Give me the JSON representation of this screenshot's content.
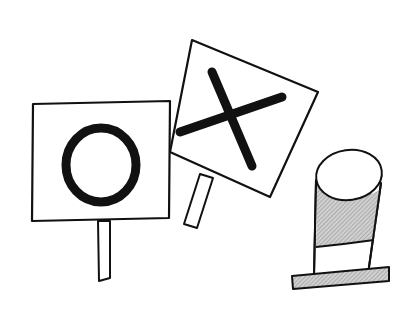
{
  "illustration": {
    "subject": "Tic-tac-toe style O and X signs with a hat",
    "elements": {
      "o_sign": {
        "symbol": "O"
      },
      "x_sign": {
        "symbol": "X"
      },
      "hat": {
        "type": "top-hat"
      }
    },
    "colors": {
      "ink": "#111111",
      "paper": "#ffffff",
      "shade": "#b8b8b8"
    }
  }
}
